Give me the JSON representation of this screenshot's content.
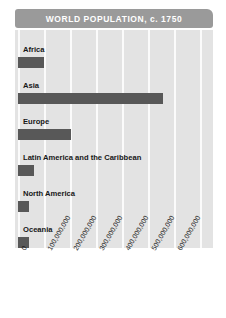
{
  "chart_data": {
    "type": "bar",
    "orientation": "horizontal",
    "title": "WORLD POPULATION, c. 1750",
    "xlabel": "",
    "ylabel": "",
    "categories": [
      "Africa",
      "Asia",
      "Europe",
      "Latin America and the Caribbean",
      "North America",
      "Oceania"
    ],
    "values": [
      95000000,
      502000000,
      163000000,
      16000000,
      2000000,
      2000000
    ],
    "xlim": [
      0,
      650000000
    ],
    "xticks": [
      0,
      100000000,
      200000000,
      300000000,
      400000000,
      500000000,
      600000000
    ],
    "xtick_labels": [
      "0",
      "100,000,000",
      "200,000,000",
      "300,000,000",
      "400,000,000",
      "500,000,000",
      "600,000,000"
    ],
    "grid": true,
    "legend": false,
    "colors": {
      "bar": "#585858",
      "plot_background": "#e3e3e3",
      "gridline": "#fbfbfb",
      "title_banner": "#9a9a9a",
      "title_text": "#ffffff",
      "label_text": "#171717",
      "page_background": "#ffffff"
    }
  },
  "bars": [
    {
      "label": "Africa",
      "width_px": 26,
      "top_px": 14
    },
    {
      "label": "Asia",
      "width_px": 145,
      "top_px": 50
    },
    {
      "label": "Europe",
      "width_px": 53,
      "top_px": 86
    },
    {
      "label": "Latin America and the Caribbean",
      "width_px": 16,
      "top_px": 122
    },
    {
      "label": "North America",
      "width_px": 11,
      "top_px": 158
    },
    {
      "label": "Oceania",
      "width_px": 11,
      "top_px": 194
    }
  ],
  "gridlines": [
    {
      "left_px": 3
    },
    {
      "left_px": 29
    },
    {
      "left_px": 55
    },
    {
      "left_px": 81
    },
    {
      "left_px": 107
    },
    {
      "left_px": 133
    },
    {
      "left_px": 159
    },
    {
      "left_px": 185
    }
  ],
  "xticks": [
    {
      "label": "0",
      "left_px": 5
    },
    {
      "label": "100,000,000",
      "left_px": 31
    },
    {
      "label": "200,000,000",
      "left_px": 57
    },
    {
      "label": "300,000,000",
      "left_px": 83
    },
    {
      "label": "400,000,000",
      "left_px": 109
    },
    {
      "label": "500,000,000",
      "left_px": 135
    },
    {
      "label": "600,000,000",
      "left_px": 161
    }
  ]
}
